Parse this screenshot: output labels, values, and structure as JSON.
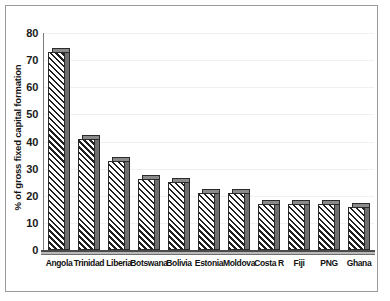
{
  "chart_data": {
    "type": "bar",
    "title": "",
    "subtitle": "",
    "xlabel": "",
    "ylabel": "% of gross fixed capital formation",
    "ylim": [
      0,
      80
    ],
    "yticks": [
      0,
      10,
      20,
      30,
      40,
      50,
      60,
      70,
      80
    ],
    "ytick_labels": [
      "0",
      "10",
      "20",
      "30",
      "40",
      "50",
      "60",
      "70",
      "80"
    ],
    "grid": "horizontal-faint",
    "legend": "none",
    "categories": [
      "Angola",
      "Trinidad",
      "Liberia",
      "Botswana",
      "Bolivia",
      "Estonia",
      "Moldova",
      "Costa R",
      "Fiji",
      "PNG",
      "Ghana"
    ],
    "values": [
      73,
      41,
      33,
      26,
      25,
      21,
      21,
      17,
      17,
      17,
      16
    ],
    "series": [
      {
        "name": "% of gross fixed capital formation",
        "values": [
          73,
          41,
          33,
          26,
          25,
          21,
          21,
          17,
          17,
          17,
          16
        ]
      }
    ],
    "style": {
      "bar_fill": "diagonal-hatch",
      "bar_edge_color": "#2a2a2a",
      "bar_side_color": "#6e6e6e",
      "bar_top_color": "#8a8a8a",
      "background": "#ffffff",
      "frame_color": "#9a9a9a",
      "gridline_color": "#f0f0f0",
      "axis_color": "#4a4a4a",
      "text_color": "#101010"
    }
  }
}
